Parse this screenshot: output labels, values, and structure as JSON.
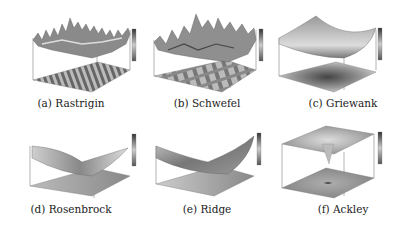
{
  "figure": {
    "panels": [
      {
        "id": "a",
        "caption": "(a) Rastrigin",
        "surface": "rastrigin"
      },
      {
        "id": "b",
        "caption": "(b) Schwefel",
        "surface": "schwefel"
      },
      {
        "id": "c",
        "caption": "(c) Griewank",
        "surface": "griewank"
      },
      {
        "id": "d",
        "caption": "(d) Rosenbrock",
        "surface": "rosenbrock"
      },
      {
        "id": "e",
        "caption": "(e) Ridge",
        "surface": "ridge"
      },
      {
        "id": "f",
        "caption": "(f) Ackley",
        "surface": "ackley"
      }
    ],
    "colormap": "grayscale",
    "colors": {
      "dark": "#3a3a3a",
      "mid": "#9a9a9a",
      "light": "#e6e6e6",
      "axis": "#555555"
    }
  }
}
